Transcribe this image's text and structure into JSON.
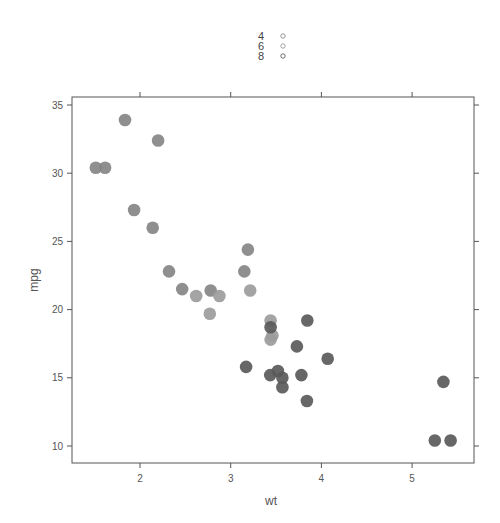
{
  "chart_data": {
    "type": "scatter",
    "title": "",
    "xlabel": "wt",
    "ylabel": "mpg",
    "xlim": [
      1.25,
      5.65
    ],
    "ylim": [
      8.8,
      35.6
    ],
    "x_ticks": [
      2,
      3,
      4,
      5
    ],
    "y_ticks": [
      10,
      15,
      20,
      25,
      30,
      35
    ],
    "grid": false,
    "legend_position": "top",
    "legend": [
      {
        "label": "4",
        "color": "#8a8a8a"
      },
      {
        "label": "6",
        "color": "#9a9a9a"
      },
      {
        "label": "8",
        "color": "#5e5e5e"
      }
    ],
    "series": [
      {
        "name": "4",
        "color": "#858585",
        "points": [
          [
            2.32,
            22.8
          ],
          [
            3.19,
            24.4
          ],
          [
            3.15,
            22.8
          ],
          [
            2.2,
            32.4
          ],
          [
            1.615,
            30.4
          ],
          [
            1.835,
            33.9
          ],
          [
            2.465,
            21.5
          ],
          [
            1.935,
            27.3
          ],
          [
            2.14,
            26.0
          ],
          [
            1.513,
            30.4
          ],
          [
            2.78,
            21.4
          ]
        ]
      },
      {
        "name": "6",
        "color": "#9c9c9c",
        "points": [
          [
            2.62,
            21.0
          ],
          [
            2.875,
            21.0
          ],
          [
            3.215,
            21.4
          ],
          [
            3.46,
            18.1
          ],
          [
            3.44,
            19.2
          ],
          [
            3.44,
            17.8
          ],
          [
            2.77,
            19.7
          ]
        ]
      },
      {
        "name": "8",
        "color": "#5a5a5a",
        "points": [
          [
            3.44,
            18.7
          ],
          [
            3.57,
            14.3
          ],
          [
            4.07,
            16.4
          ],
          [
            3.73,
            17.3
          ],
          [
            3.78,
            15.2
          ],
          [
            5.25,
            10.4
          ],
          [
            5.424,
            10.4
          ],
          [
            5.345,
            14.7
          ],
          [
            3.52,
            15.5
          ],
          [
            3.435,
            15.2
          ],
          [
            3.84,
            13.3
          ],
          [
            3.845,
            19.2
          ],
          [
            3.17,
            15.8
          ],
          [
            3.57,
            15.0
          ]
        ]
      }
    ]
  }
}
